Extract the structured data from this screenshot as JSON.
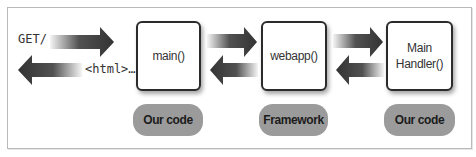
{
  "diagram": {
    "request_label": "GET/",
    "response_label": "<html>…",
    "boxes": [
      {
        "label_line1": "main()",
        "label_line2": ""
      },
      {
        "label_line1": "webapp()",
        "label_line2": ""
      },
      {
        "label_line1": "Main",
        "label_line2": "Handler()"
      }
    ],
    "pills": [
      {
        "label": "Our code"
      },
      {
        "label": "Framework"
      },
      {
        "label": "Our code"
      }
    ],
    "colors": {
      "arrow": "#333333",
      "pill": "#9b9b9b",
      "box_border": "#2b2b2b",
      "frame_border": "#b9b9b9"
    }
  }
}
